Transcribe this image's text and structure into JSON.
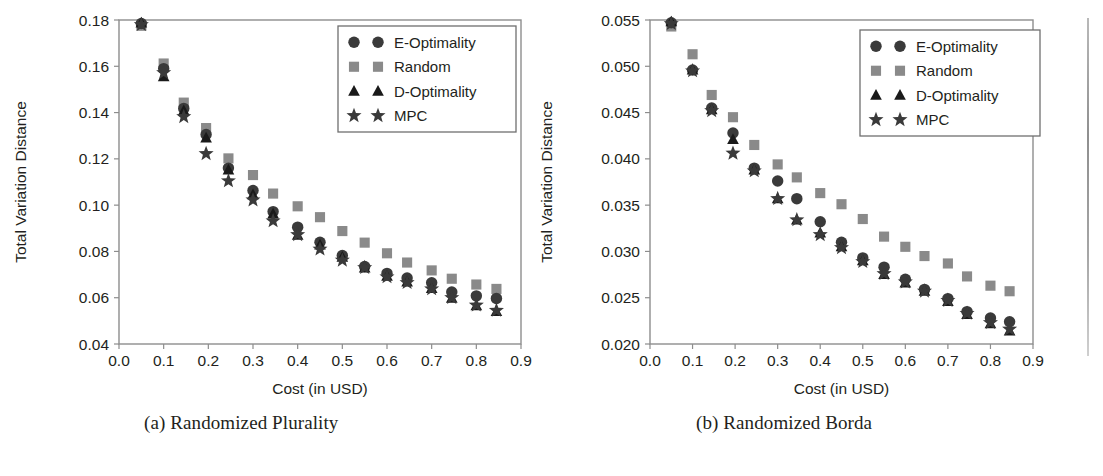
{
  "figure": {
    "panels": [
      {
        "id": "a",
        "caption": "(a) Randomized Plurality",
        "chart_data": {
          "type": "scatter",
          "title": "",
          "xlabel": "Cost (in USD)",
          "ylabel": "Total Variation Distance",
          "xlim": [
            0.0,
            0.9
          ],
          "ylim": [
            0.04,
            0.18
          ],
          "xticks": [
            "0.0",
            "0.1",
            "0.2",
            "0.3",
            "0.4",
            "0.5",
            "0.6",
            "0.7",
            "0.8",
            "0.9"
          ],
          "yticks": [
            "0.04",
            "0.06",
            "0.08",
            "0.10",
            "0.12",
            "0.14",
            "0.16",
            "0.18"
          ],
          "grid": false,
          "legend_position": "upper right",
          "x": [
            0.05,
            0.1,
            0.145,
            0.195,
            0.245,
            0.3,
            0.345,
            0.4,
            0.45,
            0.5,
            0.55,
            0.6,
            0.645,
            0.7,
            0.745,
            0.8,
            0.845
          ],
          "series": [
            {
              "name": "E-Optimality",
              "marker": "circle",
              "color": "#3a3a3a",
              "values": [
                0.1785,
                0.159,
                0.1418,
                0.1305,
                0.116,
                0.1063,
                0.0972,
                0.0905,
                0.084,
                0.0782,
                0.0735,
                0.0705,
                0.0685,
                0.0665,
                0.0625,
                0.0608,
                0.0597
              ]
            },
            {
              "name": "Random",
              "marker": "square",
              "color": "#8a8a8a",
              "values": [
                0.1775,
                0.1612,
                0.1443,
                0.1333,
                0.1202,
                0.113,
                0.105,
                0.0995,
                0.0948,
                0.0888,
                0.0838,
                0.0792,
                0.0752,
                0.0718,
                0.0682,
                0.0657,
                0.0638
              ]
            },
            {
              "name": "D-Optimality",
              "marker": "triangle",
              "color": "#1a1a1a",
              "values": [
                0.1787,
                0.1555,
                0.1408,
                0.129,
                0.1152,
                0.1045,
                0.0962,
                0.087,
                0.0828,
                0.0775,
                0.0728,
                0.0693,
                0.0668,
                0.064,
                0.0598,
                0.0565,
                0.054
              ]
            },
            {
              "name": "MPC",
              "marker": "star",
              "color": "#3a3a3a",
              "values": [
                0.178,
                0.1572,
                0.1382,
                0.1222,
                0.1105,
                0.1022,
                0.0932,
                0.0872,
                0.081,
                0.0762,
                0.073,
                0.069,
                0.0665,
                0.0638,
                0.06,
                0.0568,
                0.0545
              ]
            }
          ]
        }
      },
      {
        "id": "b",
        "caption": "(b) Randomized Borda",
        "chart_data": {
          "type": "scatter",
          "title": "",
          "xlabel": "Cost (in USD)",
          "ylabel": "Total Variation Distance",
          "xlim": [
            0.0,
            0.9
          ],
          "ylim": [
            0.02,
            0.055
          ],
          "xticks": [
            "0.0",
            "0.1",
            "0.2",
            "0.3",
            "0.4",
            "0.5",
            "0.6",
            "0.7",
            "0.8",
            "0.9"
          ],
          "yticks": [
            "0.020",
            "0.025",
            "0.030",
            "0.035",
            "0.040",
            "0.045",
            "0.050",
            "0.055"
          ],
          "grid": false,
          "legend_position": "upper right",
          "x": [
            0.05,
            0.1,
            0.145,
            0.195,
            0.245,
            0.3,
            0.345,
            0.4,
            0.45,
            0.5,
            0.55,
            0.6,
            0.645,
            0.7,
            0.745,
            0.8,
            0.845
          ],
          "series": [
            {
              "name": "E-Optimality",
              "marker": "circle",
              "color": "#3a3a3a",
              "values": [
                0.0547,
                0.0496,
                0.0455,
                0.0428,
                0.039,
                0.0376,
                0.0357,
                0.0332,
                0.031,
                0.0293,
                0.0283,
                0.027,
                0.0259,
                0.0249,
                0.0235,
                0.0228,
                0.0224
              ]
            },
            {
              "name": "Random",
              "marker": "square",
              "color": "#8a8a8a",
              "values": [
                0.0543,
                0.0513,
                0.0469,
                0.0445,
                0.0415,
                0.0394,
                0.038,
                0.0363,
                0.0351,
                0.0335,
                0.0316,
                0.0305,
                0.0295,
                0.0287,
                0.0273,
                0.0263,
                0.0257
              ]
            },
            {
              "name": "D-Optimality",
              "marker": "triangle",
              "color": "#1a1a1a",
              "values": [
                0.0548,
                0.0496,
                0.0453,
                0.0421,
                0.0388,
                0.0357,
                0.0334,
                0.032,
                0.0305,
                0.029,
                0.0275,
                0.0266,
                0.0257,
                0.0246,
                0.0232,
                0.0222,
                0.0214
              ]
            },
            {
              "name": "MPC",
              "marker": "star",
              "color": "#3a3a3a",
              "values": [
                0.0546,
                0.0495,
                0.0452,
                0.0406,
                0.0387,
                0.0357,
                0.0334,
                0.0318,
                0.0304,
                0.0289,
                0.0276,
                0.0267,
                0.0257,
                0.0247,
                0.0233,
                0.0223,
                0.0216
              ]
            }
          ]
        }
      }
    ]
  }
}
